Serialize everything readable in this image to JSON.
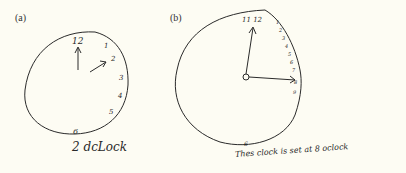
{
  "figure": {
    "background_color": "#fdfcf3",
    "ink_color": "#2a2a2a",
    "panels": [
      {
        "label": "(a)",
        "numerals": [
          "12",
          "1",
          "2",
          "3",
          "4",
          "5",
          "6"
        ],
        "hands": [
          "hour-hand-to-12",
          "minute-hand-to-2"
        ],
        "caption": "2 dcLock"
      },
      {
        "label": "(b)",
        "numerals_top": "11 12",
        "numerals_right": [
          "1",
          "2",
          "3",
          "4",
          "5",
          "6",
          "7",
          "8",
          "9"
        ],
        "numeral_bottom": "6",
        "hands": [
          "hand-to-11-12",
          "hand-to-3"
        ],
        "caption": "Thes clock is set at 8 oclock"
      }
    ]
  }
}
